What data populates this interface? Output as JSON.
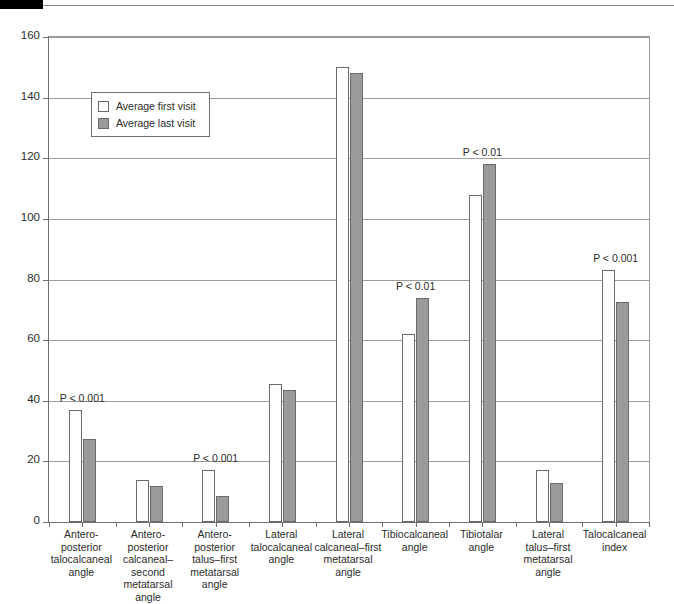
{
  "figure": {
    "y_axis_title": "Degrees",
    "y_ticks": [
      "160",
      "140",
      "120",
      "100",
      "80",
      "60",
      "40",
      "20",
      "0"
    ],
    "legend": {
      "items": [
        {
          "label": "Average first visit",
          "swatch": "white-square-icon"
        },
        {
          "label": "Average last visit",
          "swatch": "gray-square-icon"
        }
      ]
    }
  },
  "chart_data": {
    "type": "bar",
    "title": "",
    "xlabel": "",
    "ylabel": "Degrees",
    "ylim": [
      0,
      160
    ],
    "ytick_step": 20,
    "grid": true,
    "legend_position": "upper-left-inside",
    "colors": {
      "first_visit": "#ffffff",
      "last_visit": "#9a9a9a",
      "bar_outline": "#6b6b6b",
      "gridline": "#9b9b9b",
      "axis": "#6f6f6f",
      "text": "#2b2b2b"
    },
    "categories": [
      "Antero-posterior talocalcaneal angle",
      "Antero-posterior calcaneal–second metatarsal angle",
      "Antero-posterior talus–first metatarsal angle",
      "Lateral talocalcaneal angle",
      "Lateral calcaneal–first metatarsal angle",
      "Tibiocalcaneal angle",
      "Tibiotalar angle",
      "Lateral talus–first metatarsal angle",
      "Talocalcaneal index"
    ],
    "category_lines": [
      [
        "Antero-",
        "posterior",
        "talocalcaneal",
        "angle"
      ],
      [
        "Antero-",
        "posterior",
        "calcaneal–second",
        "metatarsal",
        "angle"
      ],
      [
        "Antero-",
        "posterior",
        "talus–first",
        "metatarsal",
        "angle"
      ],
      [
        "Lateral",
        "talocalcaneal",
        "angle"
      ],
      [
        "Lateral",
        "calcaneal–first",
        "metatarsal",
        "angle"
      ],
      [
        "Tibiocalcaneal",
        "angle"
      ],
      [
        "Tibiotalar",
        "angle"
      ],
      [
        "Lateral",
        "talus–first",
        "metatarsal",
        "angle"
      ],
      [
        "Talocalcaneal",
        "index"
      ]
    ],
    "series": [
      {
        "name": "Average first visit",
        "values": [
          37,
          14,
          17,
          45.5,
          150,
          62,
          108,
          17,
          83
        ]
      },
      {
        "name": "Average last visit",
        "values": [
          27.5,
          12,
          8.5,
          43.5,
          148,
          74,
          118,
          13,
          72.5
        ]
      }
    ],
    "annotations": [
      {
        "category_index": 0,
        "text": "P < 0.001"
      },
      {
        "category_index": 2,
        "text": "P < 0.001"
      },
      {
        "category_index": 5,
        "text": "P < 0.01"
      },
      {
        "category_index": 6,
        "text": "P < 0.01"
      },
      {
        "category_index": 8,
        "text": "P < 0.001"
      }
    ]
  }
}
